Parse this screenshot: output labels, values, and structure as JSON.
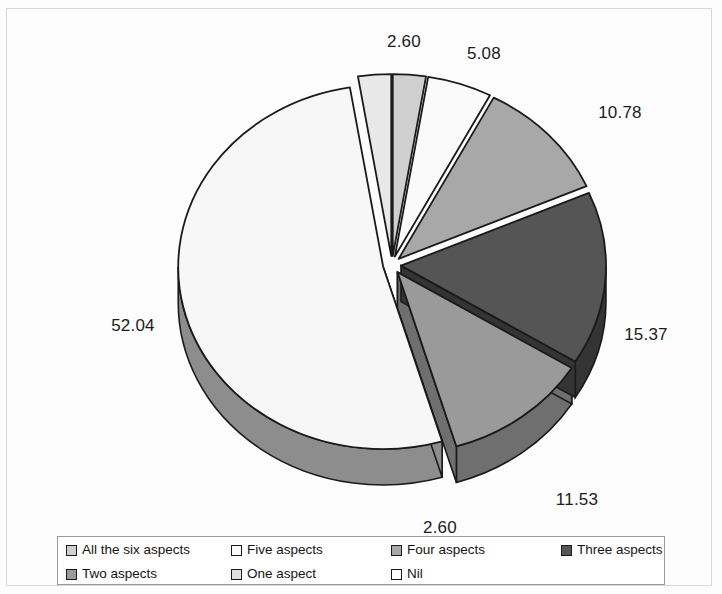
{
  "chart_data": {
    "type": "pie",
    "title": "",
    "subtitle": "",
    "xlabel": "",
    "ylabel": "",
    "three_d": true,
    "exploded": true,
    "start_angle_deg": 0,
    "direction": "clockwise",
    "legend_position": "bottom",
    "grid": false,
    "value_suffix": "",
    "categories": [
      "All the six aspects",
      "Five aspects",
      "Four aspects",
      "Three aspects",
      "Two aspects",
      "One aspect",
      "Nil"
    ],
    "values": [
      2.6,
      5.08,
      10.78,
      15.37,
      11.53,
      52.04,
      2.6
    ],
    "labels": [
      "2.60",
      "5.08",
      "10.78",
      "15.37",
      "11.53",
      "52.04",
      "2.60"
    ],
    "colors": [
      "#cfcfcf",
      "#fafafa",
      "#a8a8a8",
      "#555555",
      "#9a9a9a",
      "#f7f7f7",
      "#e8e8e8"
    ],
    "side_colors": [
      "#9e9e9e",
      "#c9c9c9",
      "#7a7a7a",
      "#343434",
      "#6f6f6f",
      "#8d8d8d",
      "#b5b5b5"
    ],
    "slices": [
      {
        "label": "All the six aspects",
        "value": 2.6,
        "display": "2.60",
        "color": "#cfcfcf",
        "side_color": "#9e9e9e"
      },
      {
        "label": "Five aspects",
        "value": 5.08,
        "display": "5.08",
        "color": "#fafafa",
        "side_color": "#c9c9c9"
      },
      {
        "label": "Four aspects",
        "value": 10.78,
        "display": "10.78",
        "color": "#a8a8a8",
        "side_color": "#7a7a7a"
      },
      {
        "label": "Three aspects",
        "value": 15.37,
        "display": "15.37",
        "color": "#555555",
        "side_color": "#343434"
      },
      {
        "label": "Two aspects",
        "value": 11.53,
        "display": "11.53",
        "color": "#9a9a9a",
        "side_color": "#6f6f6f"
      },
      {
        "label": "One aspect",
        "value": 52.04,
        "display": "52.04",
        "color": "#f7f7f7",
        "side_color": "#8d8d8d"
      },
      {
        "label": "Nil",
        "value": 2.6,
        "display": "2.60",
        "color": "#e8e8e8",
        "side_color": "#b5b5b5"
      }
    ],
    "label_positions": [
      {
        "text": "2.60",
        "x": 404,
        "y": 47
      },
      {
        "text": "5.08",
        "x": 484,
        "y": 59
      },
      {
        "text": "10.78",
        "x": 620,
        "y": 118
      },
      {
        "text": "15.37",
        "x": 646,
        "y": 340
      },
      {
        "text": "11.53",
        "x": 577,
        "y": 505
      },
      {
        "text": "2.60",
        "x": 440,
        "y": 533
      },
      {
        "text": "52.04",
        "x": 133,
        "y": 331
      }
    ]
  },
  "legend": {
    "items": [
      {
        "label": "All the six aspects",
        "color": "#cfcfcf"
      },
      {
        "label": "Five aspects",
        "color": "#fafafa"
      },
      {
        "label": "Four aspects",
        "color": "#a8a8a8"
      },
      {
        "label": "Three aspects",
        "color": "#555555"
      },
      {
        "label": "Two aspects",
        "color": "#9a9a9a"
      },
      {
        "label": "One aspect",
        "color": "#e0e0e0"
      },
      {
        "label": "Nil",
        "color": "#ffffff"
      }
    ]
  },
  "geometry": {
    "cx": 392,
    "cy": 265,
    "rx": 205,
    "ry": 182,
    "depth": 36,
    "explode": 9
  },
  "style": {
    "outline_color": "#1a1a1a",
    "label_color": "#1c1c1c",
    "background": "#fdfdfd"
  }
}
